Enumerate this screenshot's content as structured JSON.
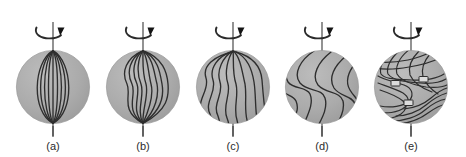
{
  "figure": {
    "background_color": "#ffffff",
    "width": 466,
    "height": 157,
    "sphere_fill": "#a9a9a9",
    "sphere_stroke": "#9a9a9a",
    "fieldline_color": "#2e2e2e",
    "axis_color": "#3a3a3a",
    "marker_fill": "#d8d8d8",
    "shadow_color": "#8f8f8f"
  },
  "panels": [
    {
      "id": "panel-a",
      "caption": "(a)",
      "cx": 53,
      "cy": 87,
      "r": 37,
      "axis_icon": "rotation-axis-arrow-icon",
      "description": "Initial poloidal field: meridional field lines run pole to pole, undistorted",
      "shear": 0.0,
      "n_lines": 9,
      "reconnection_markers": 0
    },
    {
      "id": "panel-b",
      "caption": "(b)",
      "cx": 143,
      "cy": 87,
      "r": 37,
      "axis_icon": "rotation-axis-arrow-icon",
      "description": "Differential rotation begins to drag equatorial portions of the field lines",
      "shear": 0.35,
      "n_lines": 9,
      "reconnection_markers": 0
    },
    {
      "id": "panel-c",
      "caption": "(c)",
      "cx": 233,
      "cy": 87,
      "r": 37,
      "axis_icon": "rotation-axis-arrow-icon",
      "description": "Field lines increasingly stretched and wound toward the toroidal direction",
      "shear": 0.7,
      "n_lines": 8,
      "reconnection_markers": 0
    },
    {
      "id": "panel-d",
      "caption": "(d)",
      "cx": 322,
      "cy": 87,
      "r": 37,
      "axis_icon": "rotation-axis-arrow-icon",
      "description": "Strongly sheared S-shaped field lines approaching a toroidal configuration",
      "shear": 1.1,
      "n_lines": 6,
      "reconnection_markers": 0
    },
    {
      "id": "panel-e",
      "caption": "(e)",
      "cx": 411,
      "cy": 87,
      "r": 37,
      "axis_icon": "rotation-axis-arrow-icon",
      "description": "Field wound into tight toroidal bands; small markers show reconnection / flux-rope crossings",
      "shear": 1.8,
      "n_lines": 14,
      "reconnection_markers": 3
    }
  ],
  "axis_label": "rotation axis",
  "arrow_label": "direction of rotation"
}
